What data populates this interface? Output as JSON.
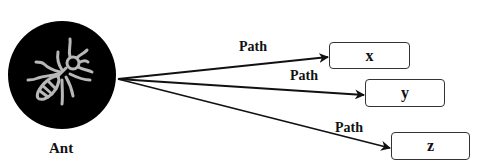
{
  "diagram": {
    "source_node": {
      "label": "Ant",
      "icon": "ant-icon",
      "fill": "#000000",
      "icon_stroke": "#b8b8b8"
    },
    "edges": [
      {
        "label": "Path",
        "target": "x"
      },
      {
        "label": "Path",
        "target": "y"
      },
      {
        "label": "Path",
        "target": "z"
      }
    ],
    "targets": [
      {
        "label": "x"
      },
      {
        "label": "y"
      },
      {
        "label": "z"
      }
    ]
  }
}
